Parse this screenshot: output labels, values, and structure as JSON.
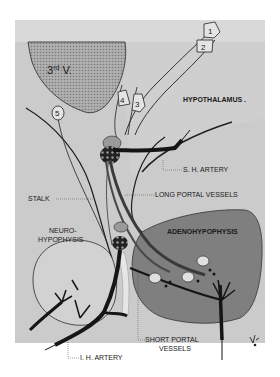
{
  "figure": {
    "colors": {
      "background": "#ffffff",
      "panel": "#c9c9c9",
      "hypothalamus_light": "#d8d8d8",
      "third_ventricle": "#a5a5a5",
      "adenohypophysis": "#7e7e7e",
      "neurohypophysis": "#cfcfcf",
      "vessels": "#151515",
      "outline": "#2a2a2a"
    },
    "regions": {
      "third_ventricle": {
        "label": "3",
        "superscript": "rd",
        "suffix": " V."
      },
      "hypothalamus": {
        "label": "HYPOTHALAMUS ."
      },
      "neurohypophysis": {
        "line1": "NEURO-",
        "line2": "HYPOPHYSIS"
      },
      "adenohypophysis": {
        "label": "ADENOHYPOPHYSIS"
      }
    },
    "nuclei": [
      {
        "id": "1",
        "label": "1"
      },
      {
        "id": "2",
        "label": "2"
      },
      {
        "id": "3",
        "label": "3"
      },
      {
        "id": "4",
        "label": "4"
      },
      {
        "id": "5",
        "label": "5"
      }
    ],
    "callouts": {
      "sh_artery": "S. H. ARTERY",
      "stalk": "STALK",
      "long_portal": "LONG PORTAL VESSELS",
      "ih_artery": "I. H. ARTERY",
      "short_portal_line1": "SHORT PORTAL",
      "short_portal_line2": "VESSELS"
    },
    "signature": "V. ..."
  }
}
